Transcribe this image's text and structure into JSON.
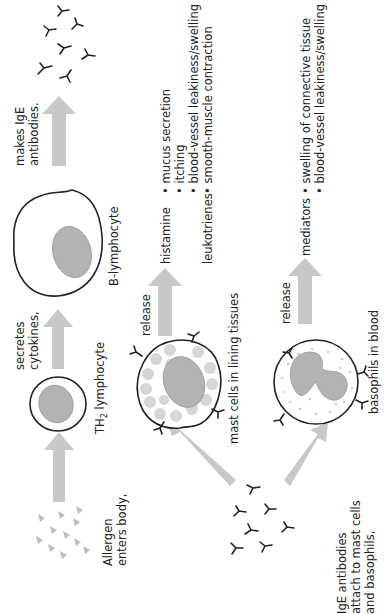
{
  "diagram": {
    "orientation": "rotated-90-ccw",
    "labels": {
      "allergen": [
        "Allergen",
        "enters body,"
      ],
      "th2": "TH₂ lymphocyte",
      "th2_main": "TH",
      "th2_sub": "2",
      "th2_rest": " lymphocyte",
      "secretes": [
        "secretes",
        "cytokines,"
      ],
      "b_lymphocyte": "B-lymphocyte",
      "makes": [
        "makes IgE",
        "antibodies."
      ],
      "ige_attach": [
        "IgE antibodies",
        "attach to mast cells",
        "and basophils,"
      ],
      "mast_cells": "mast cells in lining tissues",
      "basophils": "basophils in blood",
      "release_mast": "release",
      "release_baso": "release",
      "histamine": "histamine",
      "leukotrienes": "leukotrienes",
      "mediators": "mediators"
    },
    "histamine_effects": [
      "• mucus secretion",
      "• itching",
      "• blood-vessel leakiness/swelling"
    ],
    "leukotriene_effects": [
      "• smooth-muscle contraction"
    ],
    "mediator_effects": [
      "• swelling of connective tissue",
      "• blood-vessel leakiness/swelling"
    ],
    "colors": {
      "arrow": "#c8c8c8",
      "nucleus": "#b3b3b3",
      "granule": "#d6d6d6",
      "outline": "#222222"
    }
  }
}
